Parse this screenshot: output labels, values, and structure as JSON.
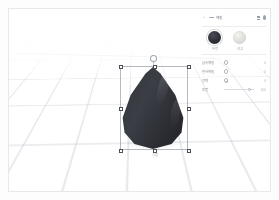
{
  "app": {
    "title": "3D Model Editor",
    "object_caption": "원뿔",
    "gizmo_mark": "⌐"
  },
  "viewport": {
    "name": "3d-viewport",
    "grid_visible": true,
    "selected_object": "cone",
    "object_color": "#2d2f35",
    "selection_border_color": "#788094"
  },
  "panel": {
    "topbar": {
      "back_icon": "chevron-left-icon",
      "menu_icon": "grid-menu-icon",
      "label": "재질",
      "bars_icon": "layers-icon",
      "pin_icon": "pin-icon"
    },
    "materials": [
      {
        "name": "dark-material",
        "label": "무광",
        "color": "#2d2f35",
        "selected": true
      },
      {
        "name": "light-material",
        "label": "석고",
        "color": "#dcdcd8",
        "selected": false
      }
    ],
    "properties": [
      {
        "label": "금속재질",
        "control": "toggle-ring",
        "value": "0"
      },
      {
        "label": "반사재질",
        "control": "toggle-ring",
        "value": "0"
      },
      {
        "label": "광택",
        "control": "toggle-dot",
        "value": "0"
      },
      {
        "label": "투명",
        "control": "slider",
        "value": "100"
      }
    ]
  }
}
